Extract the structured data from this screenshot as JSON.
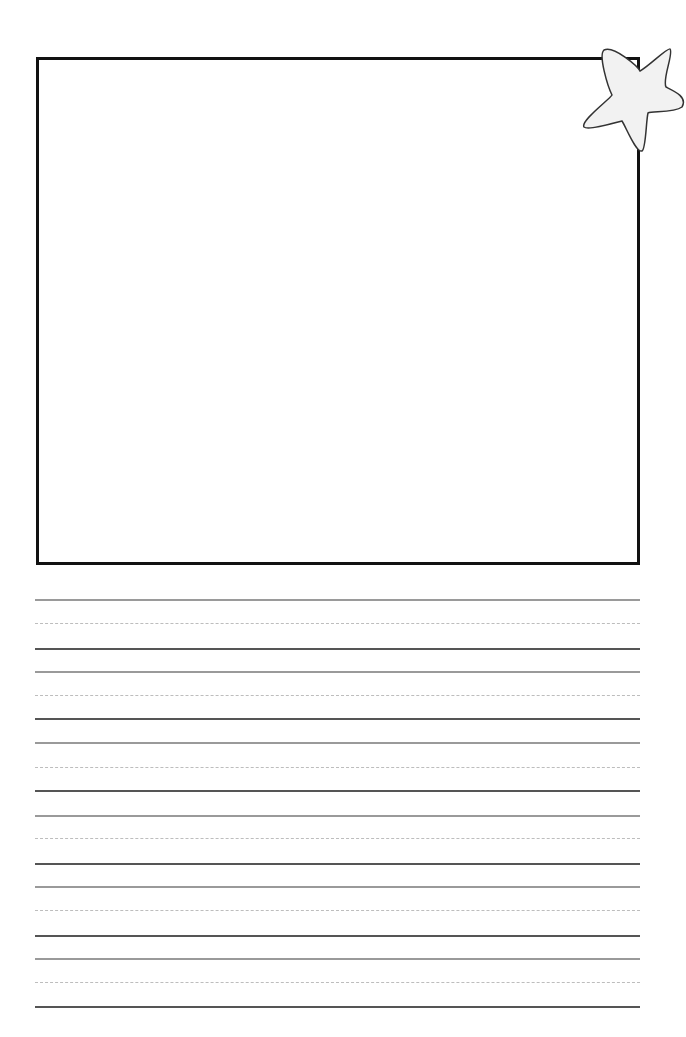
{
  "page": {
    "type": "primary-writing-paper",
    "drawing_box": {
      "label": "drawing-area"
    },
    "decoration": {
      "icon": "star-icon",
      "fill": "#f2f2f2",
      "stroke": "#333333"
    },
    "writing_lines": [
      {
        "top": 599,
        "mid": 623,
        "base": 648
      },
      {
        "top": 671,
        "mid": 695,
        "base": 718
      },
      {
        "top": 742,
        "mid": 767,
        "base": 790
      },
      {
        "top": 815,
        "mid": 838,
        "base": 863
      },
      {
        "top": 886,
        "mid": 910,
        "base": 935
      },
      {
        "top": 958,
        "mid": 982,
        "base": 1006
      }
    ]
  }
}
